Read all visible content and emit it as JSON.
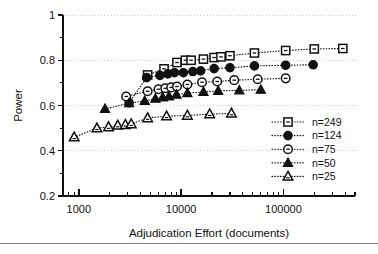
{
  "figure": {
    "background": "#ffffff",
    "foreground": "#111111",
    "grid_color": "#c9c9c9",
    "rule_color": "#7b7f86",
    "rule_y": 243
  },
  "chart_data": {
    "type": "line",
    "title": "",
    "subtitle": "",
    "xlabel": "Adjudication Effort (documents)",
    "ylabel": "Power",
    "xscale": "log",
    "yscale": "linear",
    "xlim": [
      700,
      500000
    ],
    "ylim": [
      0.2,
      1.0
    ],
    "grid": true,
    "grid_axis": "y",
    "legend_position": "lower-right-inside",
    "x_ticks_major": [
      1000,
      10000,
      100000
    ],
    "x_tick_labels": [
      "1000",
      "10000",
      "100000"
    ],
    "y_ticks_major": [
      0.2,
      0.4,
      0.6,
      0.8,
      1.0
    ],
    "y_tick_labels": [
      "0.2",
      "0.4",
      "0.6",
      "0.8",
      "1"
    ],
    "y_ticks_minor": [
      0.3,
      0.5,
      0.7,
      0.9
    ],
    "series": [
      {
        "name": "n=249",
        "legend_label": "n=249",
        "marker": "open-square",
        "filled": false,
        "x": [
          4700,
          6800,
          9100,
          11000,
          12500,
          16500,
          21000,
          24500,
          30000,
          52000,
          105000,
          200000,
          380000
        ],
        "y": [
          0.735,
          0.762,
          0.79,
          0.8,
          0.8,
          0.805,
          0.812,
          0.815,
          0.82,
          0.832,
          0.843,
          0.85,
          0.852
        ]
      },
      {
        "name": "n=124",
        "legend_label": "n=124",
        "marker": "filled-circle",
        "filled": true,
        "x": [
          3100,
          4600,
          6200,
          7400,
          8600,
          10500,
          13000,
          15500,
          21000,
          30000,
          52000,
          105000,
          195000
        ],
        "y": [
          0.612,
          0.723,
          0.733,
          0.74,
          0.745,
          0.745,
          0.75,
          0.753,
          0.763,
          0.767,
          0.775,
          0.778,
          0.78
        ]
      },
      {
        "name": "n=75",
        "legend_label": "n=75",
        "marker": "open-circle",
        "filled": false,
        "x": [
          2900,
          4700,
          6000,
          7000,
          8000,
          9100,
          11500,
          16000,
          22500,
          33000,
          56000,
          105000
        ],
        "y": [
          0.64,
          0.663,
          0.672,
          0.676,
          0.68,
          0.684,
          0.693,
          0.703,
          0.706,
          0.712,
          0.716,
          0.72
        ]
      },
      {
        "name": "n=50",
        "legend_label": "n=50",
        "marker": "filled-triangle",
        "filled": true,
        "x": [
          1800,
          3100,
          4400,
          5600,
          6600,
          7600,
          9000,
          11500,
          16500,
          23000,
          37000,
          60000
        ],
        "y": [
          0.585,
          0.61,
          0.62,
          0.63,
          0.636,
          0.64,
          0.648,
          0.655,
          0.66,
          0.665,
          0.667,
          0.67
        ]
      },
      {
        "name": "n=25",
        "legend_label": "n=25",
        "marker": "open-triangle",
        "filled": false,
        "x": [
          900,
          1500,
          1950,
          2400,
          2850,
          3250,
          4700,
          7200,
          11500,
          19000,
          31000
        ],
        "y": [
          0.46,
          0.5,
          0.505,
          0.512,
          0.515,
          0.518,
          0.545,
          0.553,
          0.556,
          0.562,
          0.565
        ]
      }
    ]
  }
}
